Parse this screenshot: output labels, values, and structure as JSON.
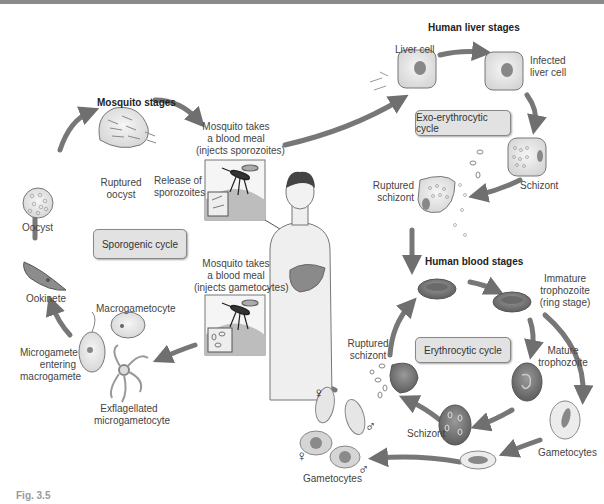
{
  "figure": {
    "caption": "Fig. 3.5",
    "colors": {
      "arrow": "#6f6f6f",
      "cell": "#ececec",
      "rbc": "#7a7a7a",
      "box": "#e2e2e2",
      "background": "#ffffff"
    }
  },
  "sections": {
    "mosquito": "Mosquito stages",
    "liver": "Human liver stages",
    "blood": "Human blood stages"
  },
  "cycles": {
    "sporogenic": "Sporogenic cycle",
    "exo_erythrocytic": "Exo-erythrocytic cycle",
    "erythrocytic": "Erythrocytic cycle"
  },
  "labels": {
    "oocyst": "Oocyst",
    "ruptured_oocyst": [
      "Ruptured",
      "oocyst"
    ],
    "release_sporozoites": [
      "Release of",
      "sporozoites"
    ],
    "mosquito_meal_1": [
      "Mosquito takes",
      "a blood meal",
      "(injects sporozoites)"
    ],
    "mosquito_meal_2": [
      "Mosquito takes",
      "a blood meal",
      "(injects gametocytes)"
    ],
    "liver_cell": "Liver cell",
    "infected_liver_cell": [
      "Infected",
      "liver cell"
    ],
    "liver_schizont": "Schizont",
    "liver_ruptured_schizont": [
      "Ruptured",
      "schizont"
    ],
    "immature_trophozoite": [
      "Immature",
      "trophozoite",
      "(ring stage)"
    ],
    "mature_trophozoite": [
      "Mature",
      "trophozoite"
    ],
    "gametocytes_right": "Gametocytes",
    "blood_schizont": "Schizont",
    "blood_ruptured_schizont": [
      "Ruptured",
      "schizont"
    ],
    "gametocytes_left": "Gametocytes",
    "ookinete": "Ookinete",
    "macrogametocyte": "Macrogametocyte",
    "microgamete_entering": [
      "Microgamete",
      "entering",
      "macrogamete"
    ],
    "exflagellated": [
      "Exflagellated",
      "microgametocyte"
    ]
  },
  "symbols": {
    "female": "♀",
    "male": "♂"
  }
}
